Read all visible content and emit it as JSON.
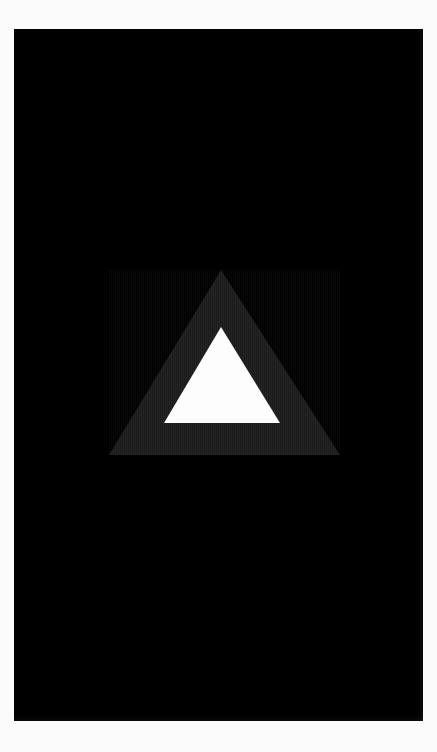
{
  "canvas": {
    "width": 437,
    "height": 752,
    "page_background": "#fbfbfb"
  },
  "panel": {
    "name": "black-panel",
    "background": "#000000",
    "x": 14,
    "y": 29,
    "width": 409,
    "height": 692
  },
  "logo": {
    "name": "triangle-logo",
    "description": "outlined triangle mark",
    "outer_triangle": {
      "fill": "#1c1c1c",
      "apex": [
        221,
        270
      ],
      "base_left": [
        109,
        455
      ],
      "base_right": [
        340,
        455
      ]
    },
    "inner_triangle": {
      "fill": "#fdfdfd",
      "apex": [
        221,
        327
      ],
      "base_left": [
        164,
        423
      ],
      "base_right": [
        280,
        423
      ]
    }
  },
  "text": {
    "title": "",
    "subtitle": "",
    "status": ""
  }
}
